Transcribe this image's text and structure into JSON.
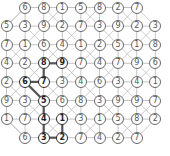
{
  "puzzle": {
    "type": "number-grid-path",
    "rows": 8,
    "cols": 9,
    "grid": [
      [
        null,
        6,
        8,
        1,
        5,
        8,
        2,
        7,
        null
      ],
      [
        5,
        3,
        9,
        2,
        7,
        3,
        9,
        2,
        3
      ],
      [
        7,
        1,
        6,
        4,
        1,
        2,
        5,
        1,
        8
      ],
      [
        4,
        2,
        8,
        9,
        7,
        4,
        7,
        9,
        6
      ],
      [
        2,
        6,
        7,
        3,
        4,
        6,
        3,
        4,
        1
      ],
      [
        9,
        3,
        5,
        6,
        8,
        3,
        9,
        9,
        7
      ],
      [
        1,
        7,
        4,
        1,
        3,
        1,
        5,
        8,
        2
      ],
      [
        null,
        6,
        3,
        2,
        7,
        4,
        2,
        7,
        null
      ]
    ],
    "highlighted_path": [
      [
        3,
        3
      ],
      [
        3,
        2
      ],
      [
        4,
        2
      ],
      [
        4,
        1
      ],
      [
        5,
        2
      ],
      [
        6,
        2
      ],
      [
        7,
        2
      ],
      [
        7,
        3
      ],
      [
        6,
        3
      ]
    ],
    "colors": {
      "line": "#b4b4b4",
      "path_line": "#555555",
      "node_border": "#6a6a6a",
      "node_highlight_border": "#2f2f2f"
    }
  }
}
